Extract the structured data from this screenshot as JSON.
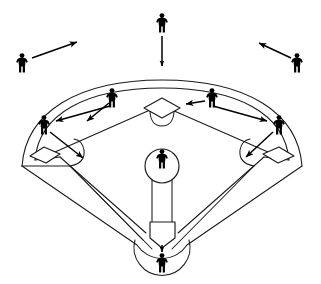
{
  "diagram": {
    "title": "Baseball Defensive Positioning Diagram",
    "description": "Overhead view of a baseball field showing nine defensive players with movement arrows indicating shifts in positioning.",
    "background_color": "#ffffff",
    "line_color": "#1a1a1a",
    "figure_color": "#000000",
    "arrow_color": "#000000",
    "width": 321,
    "height": 284
  },
  "field": {
    "outfield_fence_label": "outfield-fence-arc",
    "foul_line_left_label": "left-foul-line",
    "foul_line_right_label": "right-foul-line",
    "infield_diamond_label": "infield-diamond",
    "infield_dirt_label": "infield-dirt-cutouts",
    "home_plate_circle_label": "home-plate-circle",
    "pitchers_mound_label": "pitchers-mound",
    "bases": [
      {
        "name": "second-base",
        "x": 162,
        "y": 107
      },
      {
        "name": "third-base",
        "x": 44,
        "y": 155
      },
      {
        "name": "first-base",
        "x": 279,
        "y": 155
      },
      {
        "name": "home-plate",
        "x": 162,
        "y": 234
      }
    ]
  },
  "players": [
    {
      "id": "left-fielder",
      "label": "Left Fielder",
      "x": 22,
      "y": 62,
      "has_arrow": true,
      "arrow": {
        "x1": 31,
        "y1": 57,
        "x2": 78,
        "y2": 41,
        "direction": "up-right",
        "double_headed": false
      }
    },
    {
      "id": "center-fielder",
      "label": "Center Fielder",
      "x": 162,
      "y": 22,
      "has_arrow": true,
      "arrow": {
        "x1": 162,
        "y1": 34,
        "x2": 162,
        "y2": 67,
        "direction": "down",
        "double_headed": true
      }
    },
    {
      "id": "right-fielder",
      "label": "Right Fielder",
      "x": 297,
      "y": 62,
      "has_arrow": true,
      "arrow": {
        "x1": 291,
        "y1": 57,
        "x2": 258,
        "y2": 42,
        "direction": "up-left",
        "double_headed": false
      }
    },
    {
      "id": "shortstop",
      "label": "Shortstop",
      "x": 112,
      "y": 97,
      "has_arrow": true,
      "arrow": {
        "x1": 108,
        "y1": 104,
        "x2": 86,
        "y2": 122,
        "direction": "down-left",
        "double_headed": false
      }
    },
    {
      "id": "second-baseman",
      "label": "Second Baseman",
      "x": 212,
      "y": 97,
      "has_arrow": true,
      "arrow": {
        "x1": 204,
        "y1": 101,
        "x2": 184,
        "y2": 104,
        "direction": "left",
        "double_headed": false
      }
    },
    {
      "id": "third-baseman",
      "label": "Third Baseman",
      "x": 44,
      "y": 124,
      "has_arrow": true,
      "arrow": {
        "x1": 50,
        "y1": 131,
        "x2": 84,
        "y2": 158,
        "direction": "down-right",
        "double_headed": false
      }
    },
    {
      "id": "first-baseman",
      "label": "First Baseman",
      "x": 279,
      "y": 124,
      "has_arrow": true,
      "arrow": {
        "x1": 273,
        "y1": 131,
        "x2": 245,
        "y2": 157,
        "direction": "down-left",
        "double_headed": false
      }
    },
    {
      "id": "pitcher",
      "label": "Pitcher",
      "x": 162,
      "y": 158,
      "has_arrow": false,
      "arrow": null
    },
    {
      "id": "catcher",
      "label": "Catcher",
      "x": 162,
      "y": 262,
      "has_arrow": true,
      "arrow": {
        "x1": 162,
        "y1": 244,
        "x2": 162,
        "y2": 254,
        "direction": "down",
        "double_headed": false
      }
    }
  ],
  "long_arrows": [
    {
      "id": "shortstop-to-third-arrow",
      "label": "shortstop-range-arrow",
      "x1": 112,
      "y1": 105,
      "x2": 55,
      "y2": 120,
      "direction": "left"
    },
    {
      "id": "second-to-first-arrow",
      "label": "second-base-range-arrow",
      "x1": 212,
      "y1": 105,
      "x2": 268,
      "y2": 120,
      "direction": "right"
    }
  ]
}
